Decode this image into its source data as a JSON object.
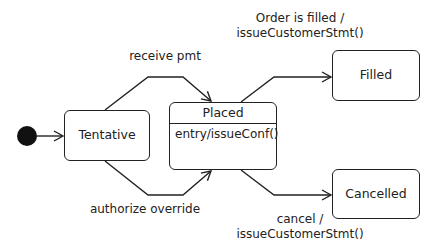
{
  "diagram": {
    "type": "uml-state-machine",
    "initial_state": "Tentative",
    "states": [
      {
        "id": "tentative",
        "name": "Tentative"
      },
      {
        "id": "placed",
        "name": "Placed",
        "activity": "entry/issueConf()"
      },
      {
        "id": "filled",
        "name": "Filled"
      },
      {
        "id": "cancelled",
        "name": "Cancelled"
      }
    ],
    "transitions": [
      {
        "from": "initial",
        "to": "tentative",
        "label": ""
      },
      {
        "from": "tentative",
        "to": "placed",
        "label": "receive pmt"
      },
      {
        "from": "tentative",
        "to": "placed",
        "label": "authorize override"
      },
      {
        "from": "placed",
        "to": "filled",
        "label_line1": "Order is filled /",
        "label_line2": "issueCustomerStmt()"
      },
      {
        "from": "placed",
        "to": "cancelled",
        "label_line1": "cancel /",
        "label_line2": "issueCustomerStmt()"
      }
    ]
  }
}
